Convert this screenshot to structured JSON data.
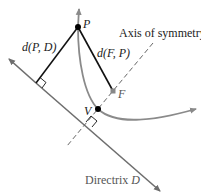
{
  "diagram": {
    "labels": {
      "point_p": "P",
      "point_f": "F",
      "point_v": "V",
      "dist_pd": "d(P, D)",
      "dist_fp": "d(F, P)",
      "axis": "Axis of symmetry",
      "directrix_word": "Directrix ",
      "directrix_letter": "D"
    },
    "colors": {
      "curve": "#8a8a8a",
      "directrix": "#6e6e6e",
      "segments": "#111111",
      "axis": "#666666",
      "points": "#000000",
      "focus": "#888888"
    },
    "points": {
      "P": [
        78,
        27
      ],
      "F": [
        113,
        91
      ],
      "V": [
        98,
        109
      ]
    }
  }
}
